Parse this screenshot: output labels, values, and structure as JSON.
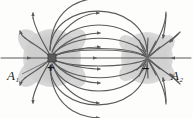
{
  "figure": {
    "name": "electric-dipole-field-lines-diagram",
    "type": "physics-diagram",
    "background_color": "#fdfdfc",
    "line_color": "#5b5b5b",
    "shade_color": "#c9c9c9",
    "charge_fill": "#595959"
  },
  "labels": {
    "a1": {
      "base": "A",
      "sub": "1"
    },
    "a2": {
      "base": "A",
      "sub": "2"
    },
    "plus_sign": "+",
    "minus_sign": "–"
  },
  "charges": [
    {
      "id": "positive-charge",
      "sign": "+",
      "x": 52,
      "y": 58,
      "marker": "filled-square"
    },
    {
      "id": "negative-charge",
      "sign": "–",
      "x": 147,
      "y": 58,
      "marker": "point"
    }
  ],
  "shaded_regions": [
    {
      "id": "left-equipotential-shade",
      "cx": 52,
      "cy": 58,
      "r": 30
    },
    {
      "id": "right-equipotential-shade",
      "cx": 147,
      "cy": 58,
      "r": 27
    }
  ]
}
